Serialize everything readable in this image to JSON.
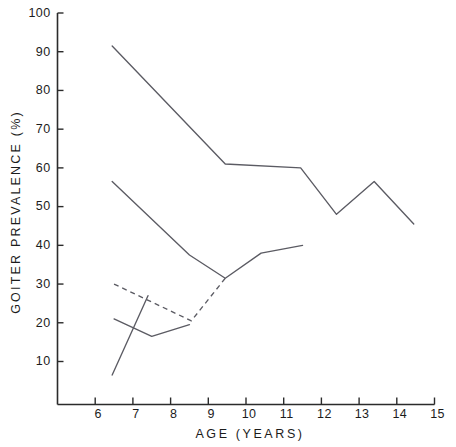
{
  "chart_data": {
    "type": "line",
    "title": "",
    "xlabel": "AGE (YEARS)",
    "ylabel": "GOITER PREVALENCE (%)",
    "xlim": [
      5,
      15
    ],
    "ylim": [
      0,
      100
    ],
    "xticks": [
      6,
      7,
      8,
      9,
      10,
      11,
      12,
      13,
      14,
      15
    ],
    "xtick_labels": [
      "6",
      "7",
      "8",
      "9",
      "10",
      "11",
      "12",
      "13",
      "14",
      "15"
    ],
    "yticks": [
      10,
      20,
      30,
      40,
      50,
      60,
      70,
      80,
      90,
      100
    ],
    "ytick_labels": [
      "10",
      "20",
      "30",
      "40",
      "50",
      "60",
      "70",
      "80",
      "90",
      "100"
    ],
    "grid": false,
    "legend": "none",
    "series": [
      {
        "name": "series-1-upper-solid",
        "style": "solid",
        "x": [
          6.45,
          9.45,
          11.45,
          12.4,
          13.4,
          14.45
        ],
        "values": [
          91.5,
          61.0,
          60.0,
          48.0,
          56.5,
          45.5
        ]
      },
      {
        "name": "series-2-middle-solid",
        "style": "solid",
        "x": [
          6.45,
          8.5,
          9.45,
          10.4,
          11.5
        ],
        "values": [
          56.5,
          37.5,
          31.5,
          38.0,
          40.0
        ]
      },
      {
        "name": "series-3-dashed",
        "style": "dashed",
        "x": [
          6.5,
          8.55,
          9.45
        ],
        "values": [
          30.0,
          20.5,
          31.5
        ]
      },
      {
        "name": "series-4-lower-solid-v",
        "style": "solid",
        "x": [
          6.5,
          7.5,
          8.5
        ],
        "values": [
          21.0,
          16.5,
          19.5
        ]
      },
      {
        "name": "series-5-steep-ascending-solid",
        "style": "solid",
        "x": [
          6.45,
          7.4
        ],
        "values": [
          6.5,
          27.0
        ]
      }
    ]
  },
  "axes": {
    "y_axis_title": "GOITER PREVALENCE (%)",
    "x_axis_title": "AGE (YEARS)"
  }
}
